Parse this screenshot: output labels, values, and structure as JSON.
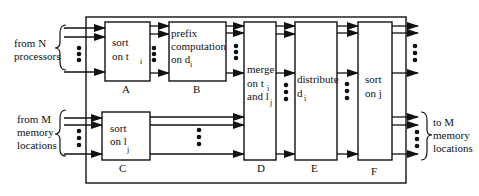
{
  "inputs": {
    "processors": {
      "line1": "from N",
      "line2": "processors"
    },
    "memory": {
      "line1": "from M",
      "line2": "memory",
      "line3": "locations"
    }
  },
  "output": {
    "line1": "to M",
    "line2": "memory",
    "line3": "locations"
  },
  "blocks": [
    {
      "id": "A",
      "label": "A",
      "lines": [
        "sort",
        "on t"
      ],
      "subscript": "i"
    },
    {
      "id": "B",
      "label": "B",
      "lines": [
        "prefix",
        "computation",
        "on d"
      ],
      "subscript": "i"
    },
    {
      "id": "C",
      "label": "C",
      "lines": [
        "sort",
        "on l"
      ],
      "subscript": "j"
    },
    {
      "id": "D",
      "label": "D",
      "lines": [
        "merge",
        "on t",
        "and l"
      ],
      "subscripts": [
        "i",
        "j"
      ]
    },
    {
      "id": "E",
      "label": "E",
      "lines": [
        "distribute",
        "d"
      ],
      "subscript": "i"
    },
    {
      "id": "F",
      "label": "F",
      "lines": [
        "sort",
        "on j"
      ]
    }
  ],
  "colors": {
    "stroke": "#111111",
    "background": "#ffffff"
  }
}
